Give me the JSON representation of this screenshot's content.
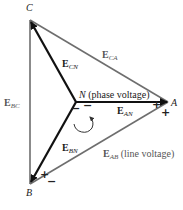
{
  "diagram": {
    "type": "three-phase wye voltage phasor diagram",
    "colors": {
      "line_voltage": "#6e6e6e",
      "phase_voltage": "#111111",
      "text": "#1a1a1a"
    },
    "nodes": {
      "A": {
        "label": "A",
        "x": 168,
        "y": 102
      },
      "B": {
        "label": "B",
        "x": 30,
        "y": 184
      },
      "C": {
        "label": "C",
        "x": 30,
        "y": 20
      },
      "N": {
        "label": "N",
        "x": 76,
        "y": 102
      }
    },
    "labels": {
      "node_a": "A",
      "node_b": "B",
      "node_c": "C",
      "node_n": "N",
      "node_n_note": "(phase voltage)",
      "e_ca_main": "E",
      "e_ca_sub": "CA",
      "e_cn_main": "E",
      "e_cn_sub": "CN",
      "e_bc_main": "E",
      "e_bc_sub": "BC",
      "e_an_main": "E",
      "e_an_sub": "AN",
      "e_bn_main": "E",
      "e_bn_sub": "BN",
      "e_ab_main": "E",
      "e_ab_sub": "AB",
      "e_ab_note": "(line voltage)"
    },
    "signs": {
      "n_minus_left": "−",
      "n_minus_right": "−",
      "a_plus_upper": "+",
      "a_plus_lower": "+",
      "b_plus": "+",
      "b_minus": "−"
    },
    "phase_vectors": [
      {
        "name": "E_AN",
        "from": "N",
        "to": "A"
      },
      {
        "name": "E_BN",
        "from": "N",
        "to": "B"
      },
      {
        "name": "E_CN",
        "from": "N",
        "to": "C"
      }
    ],
    "line_vectors": [
      {
        "name": "E_AB",
        "between": [
          "A",
          "B"
        ]
      },
      {
        "name": "E_BC",
        "between": [
          "B",
          "C"
        ]
      },
      {
        "name": "E_CA",
        "between": [
          "C",
          "A"
        ]
      }
    ],
    "rotation": "counter-clockwise arrow near N"
  }
}
